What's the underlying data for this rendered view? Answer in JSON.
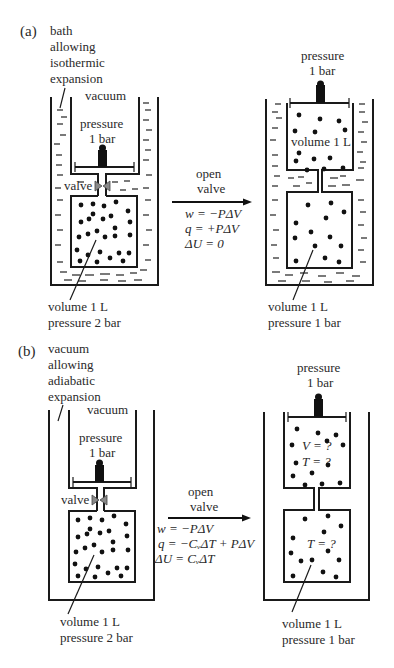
{
  "panel_a": {
    "label": "(a)",
    "bath_label": [
      "bath",
      "allowing",
      "isothermic",
      "expansion"
    ],
    "left": {
      "vacuum": "vacuum",
      "pressure": [
        "pressure",
        "1 bar"
      ],
      "valve": "valve",
      "gas": [
        "volume 1 L",
        "pressure 2 bar"
      ]
    },
    "arrow": {
      "label": [
        "open",
        "valve"
      ],
      "equations": [
        "w = −PΔV",
        "q = +PΔV",
        "ΔU = 0"
      ]
    },
    "right": {
      "pressure": [
        "pressure",
        "1 bar"
      ],
      "upper_volume": "volume 1 L",
      "gas": [
        "volume 1 L",
        "pressure 1 bar"
      ]
    }
  },
  "panel_b": {
    "label": "(b)",
    "vacuum_label": [
      "vacuum",
      "allowing",
      "adiabatic",
      "expansion"
    ],
    "left": {
      "vacuum": "vacuum",
      "pressure": [
        "pressure",
        "1 bar"
      ],
      "valve": "valve",
      "gas": [
        "volume 1 L",
        "pressure 2 bar"
      ]
    },
    "arrow": {
      "label": [
        "open",
        "valve"
      ],
      "equations": [
        "w = −PΔV",
        "q = −CᵥΔT + PΔV",
        "ΔU = CᵥΔT"
      ]
    },
    "right": {
      "pressure": [
        "pressure",
        "1 bar"
      ],
      "upper": [
        "V = ?",
        "T = ?"
      ],
      "lower": "T = ?",
      "gas": [
        "volume 1 L",
        "pressure 1 bar"
      ]
    }
  }
}
